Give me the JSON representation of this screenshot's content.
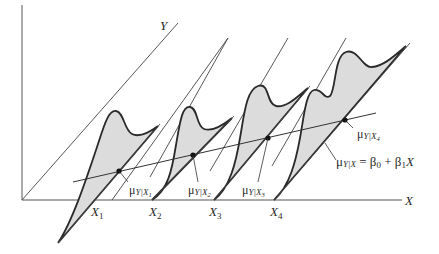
{
  "figure": {
    "colors": {
      "fill": "#dcdcdc",
      "stroke": "#2a2a2a",
      "background": "#ffffff"
    }
  },
  "axes": {
    "x_label": "X",
    "y_label": "Y"
  },
  "x_ticks": [
    {
      "main": "X",
      "sub": "1"
    },
    {
      "main": "X",
      "sub": "2"
    },
    {
      "main": "X",
      "sub": "3"
    },
    {
      "main": "X",
      "sub": "4"
    }
  ],
  "means": [
    {
      "mu": "μ",
      "sub_main": "Y|X",
      "sub_index": "1"
    },
    {
      "mu": "μ",
      "sub_main": "Y|X",
      "sub_index": "2"
    },
    {
      "mu": "μ",
      "sub_main": "Y|X",
      "sub_index": "3"
    },
    {
      "mu": "μ",
      "sub_main": "Y|X",
      "sub_index": "4"
    }
  ],
  "regression_equation": {
    "mu": "μ",
    "sub": "Y|X",
    "rhs_prefix": " = β",
    "b0_sub": "0",
    "plus": " + β",
    "b1_sub": "1",
    "var": "X"
  }
}
